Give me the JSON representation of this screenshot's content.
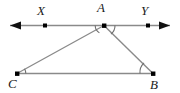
{
  "figure": {
    "kind": "geometry-diagram",
    "width": 180,
    "height": 93,
    "background_color": "#ffffff",
    "stroke_color": "#888888",
    "point_color": "#000000",
    "label_color": "#1a1a1a"
  },
  "labels": {
    "x": {
      "text": "X",
      "left": 37,
      "top": 4
    },
    "a": {
      "text": "A",
      "left": 97,
      "top": 1
    },
    "y": {
      "text": "Y",
      "left": 141,
      "top": 4
    },
    "c": {
      "text": "C",
      "left": 8,
      "top": 77
    },
    "b": {
      "text": "B",
      "left": 150,
      "top": 78
    }
  },
  "points": [
    {
      "name": "X",
      "x": 45,
      "y": 25.5
    },
    {
      "name": "A",
      "x": 104,
      "y": 25.5
    },
    {
      "name": "Y",
      "x": 148,
      "y": 25.5
    },
    {
      "name": "C",
      "x": 17,
      "y": 73.5
    },
    {
      "name": "B",
      "x": 153,
      "y": 73.5
    }
  ],
  "segments": [
    {
      "name": "line-xy",
      "from": "arrow-left",
      "to": "arrow-right",
      "x1": 8,
      "y1": 25.5,
      "x2": 172,
      "y2": 25.5,
      "double_arrow": true
    },
    {
      "name": "segment-ac",
      "from": "A",
      "to": "C",
      "x1": 104,
      "y1": 25.5,
      "x2": 17,
      "y2": 73.5,
      "double_arrow": false
    },
    {
      "name": "segment-ab",
      "from": "A",
      "to": "B",
      "x1": 104,
      "y1": 25.5,
      "x2": 153,
      "y2": 73.5,
      "double_arrow": false
    },
    {
      "name": "segment-cb",
      "from": "C",
      "to": "B",
      "x1": 17,
      "y1": 73.5,
      "x2": 153,
      "y2": 73.5,
      "double_arrow": false
    }
  ],
  "angle_marks": [
    {
      "name": "angle-xac",
      "vertex": "A",
      "radius": 9
    },
    {
      "name": "angle-yab",
      "vertex": "A",
      "radius": 11
    },
    {
      "name": "angle-acb",
      "vertex": "C",
      "radius": 9
    },
    {
      "name": "angle-abc",
      "vertex": "B",
      "radius": 13
    }
  ]
}
